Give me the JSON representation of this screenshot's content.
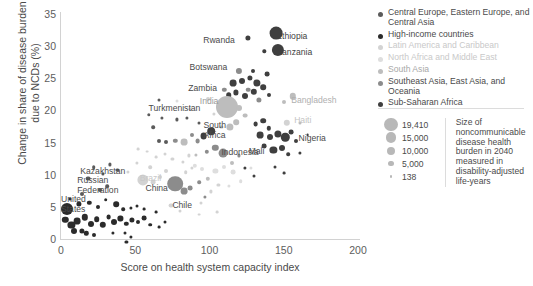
{
  "chart_data": {
    "type": "scatter",
    "title": "",
    "subtitle": "",
    "xlabel": "Score on health system capacity index",
    "ylabel": "Change in share of disease burden\ndue to NCDs (%)",
    "xlim": [
      0,
      200
    ],
    "ylim": [
      0,
      35
    ],
    "xticks": [
      0,
      50,
      100,
      150,
      200
    ],
    "yticks": [
      0,
      5,
      10,
      15,
      20,
      25,
      30,
      35
    ],
    "grid": false,
    "legend_position": "right",
    "size_metric": "Size of noncommunicable disease health burden in 2040 measured in disability-adjusted life-years",
    "size_legend": [
      {
        "value": "19,410",
        "px": 11
      },
      {
        "value": "15,000",
        "px": 8.6
      },
      {
        "value": "10,000",
        "px": 6.4
      },
      {
        "value": "5,000",
        "px": 4.2
      },
      {
        "value": "138",
        "px": 2.0
      }
    ],
    "groups": [
      {
        "name": "Central Europe, Eastern Europe, and Central Asia",
        "color": "#5b5b5b"
      },
      {
        "name": "High-income countries",
        "color": "#2b2b2b"
      },
      {
        "name": "Latin America and Caribbean",
        "color": "#d3d3d3"
      },
      {
        "name": "North Africa and Middle East",
        "color": "#dedede"
      },
      {
        "name": "South Asia",
        "color": "#bdbdbd"
      },
      {
        "name": "Southeast Asia, East Asia, and Oceania",
        "color": "#8c8c8c"
      },
      {
        "name": "Sub-Saharan Africa",
        "color": "#3f3f3f"
      }
    ],
    "annotations": [
      {
        "text": "Ethiopia",
        "x": 145,
        "y": 31.5,
        "anchor": "left",
        "color": "#3f3f3f"
      },
      {
        "text": "Tanzania",
        "x": 146,
        "y": 29.0,
        "anchor": "left",
        "color": "#3f3f3f"
      },
      {
        "text": "Rwanda",
        "x": 117,
        "y": 30.8,
        "anchor": "right",
        "color": "#4a4a4a"
      },
      {
        "text": "Botswana",
        "x": 112,
        "y": 26.6,
        "anchor": "right",
        "color": "#4a4a4a"
      },
      {
        "text": "Zambia",
        "x": 105,
        "y": 23.4,
        "anchor": "right",
        "color": "#4a4a4a"
      },
      {
        "text": "India",
        "x": 106,
        "y": 21.3,
        "anchor": "right",
        "color": "#9a9a9a"
      },
      {
        "text": "Bangladesh",
        "x": 155,
        "y": 21.5,
        "anchor": "left",
        "color": "#b0b0b0"
      },
      {
        "text": "Haiti",
        "x": 157,
        "y": 18.3,
        "anchor": "left",
        "color": "#c4c4c4"
      },
      {
        "text": "Nigeria",
        "x": 160,
        "y": 15.6,
        "anchor": "left",
        "color": "#4a4a4a"
      },
      {
        "text": "Mali",
        "x": 137,
        "y": 13.6,
        "anchor": "right",
        "color": "#4a4a4a"
      },
      {
        "text": "Indonesia",
        "x": 108,
        "y": 13.4,
        "anchor": "left",
        "color": "#4a4a4a"
      },
      {
        "text": "Turkmenistan",
        "x": 59,
        "y": 20.3,
        "anchor": "left",
        "color": "#4a4a4a"
      },
      {
        "text": "South\nAfrica",
        "x": 96,
        "y": 16.8,
        "anchor": "left",
        "color": "#4a4a4a"
      },
      {
        "text": "Kazakhstan",
        "x": 13,
        "y": 10.4,
        "anchor": "left",
        "color": "#4a4a4a"
      },
      {
        "text": "Russian\nFederation",
        "x": 11,
        "y": 8.2,
        "anchor": "left",
        "color": "#4a4a4a"
      },
      {
        "text": "United\nStates",
        "x": 0,
        "y": 5.3,
        "anchor": "left",
        "color": "#4a4a4a"
      },
      {
        "text": "Brazil",
        "x": 53,
        "y": 9.4,
        "anchor": "left",
        "color": "#c9c9c9"
      },
      {
        "text": "China",
        "x": 72,
        "y": 7.8,
        "anchor": "right",
        "color": "#4a4a4a"
      },
      {
        "text": "Chile",
        "x": 75,
        "y": 5.2,
        "anchor": "left",
        "color": "#4a4a4a"
      }
    ],
    "points": [
      {
        "x": 145,
        "y": 32.0,
        "r": 6.4,
        "g": 6
      },
      {
        "x": 146,
        "y": 29.4,
        "r": 6.1,
        "g": 6
      },
      {
        "x": 126,
        "y": 31.3,
        "r": 2.6,
        "g": 6
      },
      {
        "x": 137,
        "y": 29.2,
        "r": 1.7,
        "g": 6
      },
      {
        "x": 129,
        "y": 26.2,
        "r": 2.0,
        "g": 6
      },
      {
        "x": 139,
        "y": 25.6,
        "r": 2.4,
        "g": 6
      },
      {
        "x": 116,
        "y": 24.3,
        "r": 3.4,
        "g": 6
      },
      {
        "x": 122,
        "y": 24.6,
        "r": 3.0,
        "g": 6
      },
      {
        "x": 127,
        "y": 25.0,
        "r": 2.6,
        "g": 6
      },
      {
        "x": 132,
        "y": 24.3,
        "r": 3.6,
        "g": 6
      },
      {
        "x": 136,
        "y": 23.6,
        "r": 2.8,
        "g": 6
      },
      {
        "x": 130,
        "y": 22.9,
        "r": 3.2,
        "g": 6
      },
      {
        "x": 124,
        "y": 22.2,
        "r": 3.0,
        "g": 6
      },
      {
        "x": 118,
        "y": 22.8,
        "r": 2.6,
        "g": 6
      },
      {
        "x": 113,
        "y": 22.4,
        "r": 2.8,
        "g": 6
      },
      {
        "x": 110,
        "y": 23.2,
        "r": 2.2,
        "g": 5
      },
      {
        "x": 120,
        "y": 26.1,
        "r": 3.1,
        "g": 5
      },
      {
        "x": 126,
        "y": 23.2,
        "r": 2.3,
        "g": 5
      },
      {
        "x": 133,
        "y": 21.6,
        "r": 2.6,
        "g": 5
      },
      {
        "x": 140,
        "y": 22.4,
        "r": 2.0,
        "g": 6
      },
      {
        "x": 112,
        "y": 20.6,
        "r": 11.0,
        "g": 4
      },
      {
        "x": 120,
        "y": 20.4,
        "r": 3.0,
        "g": 4
      },
      {
        "x": 124,
        "y": 19.2,
        "r": 2.4,
        "g": 4
      },
      {
        "x": 118,
        "y": 18.2,
        "r": 2.8,
        "g": 4
      },
      {
        "x": 114,
        "y": 17.4,
        "r": 3.6,
        "g": 4
      },
      {
        "x": 150,
        "y": 21.3,
        "r": 2.0,
        "g": 4
      },
      {
        "x": 152,
        "y": 18.1,
        "r": 3.2,
        "g": 2
      },
      {
        "x": 156,
        "y": 22.2,
        "r": 3.2,
        "g": 4
      },
      {
        "x": 131,
        "y": 17.9,
        "r": 2.4,
        "g": 6
      },
      {
        "x": 136,
        "y": 18.4,
        "r": 2.8,
        "g": 6
      },
      {
        "x": 140,
        "y": 17.2,
        "r": 2.2,
        "g": 6
      },
      {
        "x": 134,
        "y": 16.2,
        "r": 3.4,
        "g": 6
      },
      {
        "x": 141,
        "y": 15.8,
        "r": 3.0,
        "g": 6
      },
      {
        "x": 146,
        "y": 16.4,
        "r": 3.6,
        "g": 6
      },
      {
        "x": 151,
        "y": 15.8,
        "r": 4.2,
        "g": 6
      },
      {
        "x": 155,
        "y": 16.6,
        "r": 2.4,
        "g": 6
      },
      {
        "x": 158,
        "y": 15.2,
        "r": 2.0,
        "g": 6
      },
      {
        "x": 149,
        "y": 14.2,
        "r": 3.0,
        "g": 6
      },
      {
        "x": 143,
        "y": 13.9,
        "r": 3.6,
        "g": 6
      },
      {
        "x": 137,
        "y": 14.5,
        "r": 2.4,
        "g": 6
      },
      {
        "x": 153,
        "y": 13.2,
        "r": 1.8,
        "g": 6
      },
      {
        "x": 161,
        "y": 13.4,
        "r": 1.6,
        "g": 6
      },
      {
        "x": 96,
        "y": 16.0,
        "r": 3.4,
        "g": 6
      },
      {
        "x": 101,
        "y": 16.8,
        "r": 3.8,
        "g": 6
      },
      {
        "x": 92,
        "y": 15.2,
        "r": 2.4,
        "g": 5
      },
      {
        "x": 88,
        "y": 16.2,
        "r": 2.0,
        "g": 5
      },
      {
        "x": 83,
        "y": 15.1,
        "r": 3.4,
        "g": 4
      },
      {
        "x": 77,
        "y": 15.3,
        "r": 2.2,
        "g": 5
      },
      {
        "x": 71,
        "y": 15.1,
        "r": 2.0,
        "g": 0
      },
      {
        "x": 66,
        "y": 15.2,
        "r": 2.0,
        "g": 0
      },
      {
        "x": 62,
        "y": 17.4,
        "r": 1.8,
        "g": 0
      },
      {
        "x": 68,
        "y": 18.8,
        "r": 1.6,
        "g": 0
      },
      {
        "x": 78,
        "y": 18.6,
        "r": 1.6,
        "g": 0
      },
      {
        "x": 85,
        "y": 18.9,
        "r": 1.6,
        "g": 0
      },
      {
        "x": 59,
        "y": 19.3,
        "r": 1.7,
        "g": 0
      },
      {
        "x": 93,
        "y": 18.0,
        "r": 1.5,
        "g": 0
      },
      {
        "x": 104,
        "y": 14.2,
        "r": 3.2,
        "g": 5
      },
      {
        "x": 109,
        "y": 13.4,
        "r": 4.4,
        "g": 5
      },
      {
        "x": 98,
        "y": 13.6,
        "r": 2.2,
        "g": 5
      },
      {
        "x": 91,
        "y": 13.1,
        "r": 1.6,
        "g": 4
      },
      {
        "x": 86,
        "y": 13.0,
        "r": 1.6,
        "g": 2
      },
      {
        "x": 104,
        "y": 10.6,
        "r": 2.6,
        "g": 3
      },
      {
        "x": 110,
        "y": 11.2,
        "r": 2.0,
        "g": 3
      },
      {
        "x": 116,
        "y": 10.4,
        "r": 2.4,
        "g": 3
      },
      {
        "x": 99,
        "y": 9.4,
        "r": 2.2,
        "g": 4
      },
      {
        "x": 95,
        "y": 10.9,
        "r": 2.0,
        "g": 3
      },
      {
        "x": 121,
        "y": 9.0,
        "r": 1.8,
        "g": 3
      },
      {
        "x": 113,
        "y": 8.2,
        "r": 1.6,
        "g": 3
      },
      {
        "x": 106,
        "y": 8.4,
        "r": 1.6,
        "g": 2
      },
      {
        "x": 128,
        "y": 11.1,
        "r": 1.6,
        "g": 3
      },
      {
        "x": 90,
        "y": 11.4,
        "r": 2.2,
        "g": 3
      },
      {
        "x": 84,
        "y": 10.4,
        "r": 1.8,
        "g": 2
      },
      {
        "x": 77,
        "y": 8.6,
        "r": 7.8,
        "g": 5
      },
      {
        "x": 83,
        "y": 7.5,
        "r": 3.4,
        "g": 5
      },
      {
        "x": 87,
        "y": 7.9,
        "r": 2.4,
        "g": 5
      },
      {
        "x": 55,
        "y": 9.2,
        "r": 5.6,
        "g": 2
      },
      {
        "x": 62,
        "y": 8.9,
        "r": 2.4,
        "g": 2
      },
      {
        "x": 67,
        "y": 9.6,
        "r": 2.0,
        "g": 2
      },
      {
        "x": 71,
        "y": 10.6,
        "r": 2.0,
        "g": 2
      },
      {
        "x": 60,
        "y": 11.2,
        "r": 1.8,
        "g": 2
      },
      {
        "x": 51,
        "y": 11.8,
        "r": 1.6,
        "g": 2
      },
      {
        "x": 45,
        "y": 10.4,
        "r": 1.6,
        "g": 2
      },
      {
        "x": 93,
        "y": 8.8,
        "r": 1.8,
        "g": 5
      },
      {
        "x": 97,
        "y": 6.6,
        "r": 1.6,
        "g": 5
      },
      {
        "x": 74,
        "y": 5.2,
        "r": 2.4,
        "g": 2
      },
      {
        "x": 80,
        "y": 4.4,
        "r": 1.5,
        "g": 2
      },
      {
        "x": 18,
        "y": 9.4,
        "r": 2.4,
        "g": 0
      },
      {
        "x": 22,
        "y": 11.2,
        "r": 1.8,
        "g": 0
      },
      {
        "x": 28,
        "y": 10.1,
        "r": 1.6,
        "g": 0
      },
      {
        "x": 33,
        "y": 11.6,
        "r": 1.6,
        "g": 0
      },
      {
        "x": 38,
        "y": 10.8,
        "r": 1.6,
        "g": 0
      },
      {
        "x": 26,
        "y": 7.6,
        "r": 2.0,
        "g": 0
      },
      {
        "x": 31,
        "y": 8.2,
        "r": 1.8,
        "g": 0
      },
      {
        "x": 14,
        "y": 7.0,
        "r": 2.0,
        "g": 0
      },
      {
        "x": 4,
        "y": 4.6,
        "r": 6.0,
        "g": 1
      },
      {
        "x": 3,
        "y": 3.0,
        "r": 3.2,
        "g": 1
      },
      {
        "x": 7,
        "y": 2.2,
        "r": 3.6,
        "g": 1
      },
      {
        "x": 11,
        "y": 2.8,
        "r": 3.4,
        "g": 1
      },
      {
        "x": 9,
        "y": 1.2,
        "r": 3.0,
        "g": 1
      },
      {
        "x": 14,
        "y": 1.3,
        "r": 2.6,
        "g": 1
      },
      {
        "x": 16,
        "y": 3.4,
        "r": 3.2,
        "g": 1
      },
      {
        "x": 20,
        "y": 2.4,
        "r": 3.0,
        "g": 1
      },
      {
        "x": 24,
        "y": 3.1,
        "r": 2.8,
        "g": 1
      },
      {
        "x": 28,
        "y": 2.2,
        "r": 3.2,
        "g": 1
      },
      {
        "x": 32,
        "y": 3.4,
        "r": 2.4,
        "g": 1
      },
      {
        "x": 36,
        "y": 2.6,
        "r": 3.0,
        "g": 1
      },
      {
        "x": 40,
        "y": 3.2,
        "r": 2.6,
        "g": 1
      },
      {
        "x": 44,
        "y": 2.4,
        "r": 2.2,
        "g": 1
      },
      {
        "x": 48,
        "y": 3.0,
        "r": 2.6,
        "g": 1
      },
      {
        "x": 52,
        "y": 2.6,
        "r": 2.0,
        "g": 1
      },
      {
        "x": 56,
        "y": 3.2,
        "r": 2.4,
        "g": 1
      },
      {
        "x": 60,
        "y": 2.2,
        "r": 1.8,
        "g": 1
      },
      {
        "x": 12,
        "y": 5.4,
        "r": 2.6,
        "g": 1
      },
      {
        "x": 19,
        "y": 5.6,
        "r": 2.2,
        "g": 1
      },
      {
        "x": 25,
        "y": 5.0,
        "r": 2.0,
        "g": 1
      },
      {
        "x": 30,
        "y": 6.1,
        "r": 1.8,
        "g": 1
      },
      {
        "x": 37,
        "y": 5.4,
        "r": 2.8,
        "g": 1
      },
      {
        "x": 42,
        "y": 4.6,
        "r": 1.8,
        "g": 1
      },
      {
        "x": 47,
        "y": 4.8,
        "r": 1.6,
        "g": 1
      },
      {
        "x": 51,
        "y": 5.2,
        "r": 1.5,
        "g": 1
      },
      {
        "x": 56,
        "y": 4.6,
        "r": 1.4,
        "g": 1
      },
      {
        "x": 64,
        "y": 4.2,
        "r": 1.4,
        "g": 1
      },
      {
        "x": 35,
        "y": 1.0,
        "r": 1.6,
        "g": 1
      },
      {
        "x": 43,
        "y": 0.9,
        "r": 1.5,
        "g": 1
      },
      {
        "x": 44,
        "y": -0.4,
        "r": 1.6,
        "g": 1
      },
      {
        "x": 47,
        "y": 0.3,
        "r": 1.6,
        "g": 1
      },
      {
        "x": 70,
        "y": 2.6,
        "r": 1.5,
        "g": 1
      },
      {
        "x": 66,
        "y": 1.8,
        "r": 1.4,
        "g": 1
      },
      {
        "x": 22,
        "y": 0.6,
        "r": 2.0,
        "g": 1
      },
      {
        "x": 17,
        "y": 0.9,
        "r": 2.2,
        "g": 1
      },
      {
        "x": 6,
        "y": 6.2,
        "r": 1.6,
        "g": 1
      },
      {
        "x": 99,
        "y": 21.8,
        "r": 2.0,
        "g": 2
      },
      {
        "x": 103,
        "y": 19.4,
        "r": 1.6,
        "g": 2
      },
      {
        "x": 87,
        "y": 20.2,
        "r": 1.6,
        "g": 2
      },
      {
        "x": 78,
        "y": 21.4,
        "r": 1.5,
        "g": 3
      },
      {
        "x": 66,
        "y": 21.6,
        "r": 1.5,
        "g": 0
      },
      {
        "x": 108,
        "y": 17.4,
        "r": 1.6,
        "g": 4
      },
      {
        "x": 115,
        "y": 11.8,
        "r": 2.0,
        "g": 4
      },
      {
        "x": 120,
        "y": 13.0,
        "r": 1.6,
        "g": 5
      },
      {
        "x": 124,
        "y": 11.0,
        "r": 1.6,
        "g": 6
      },
      {
        "x": 130,
        "y": 9.8,
        "r": 1.5,
        "g": 6
      },
      {
        "x": 101,
        "y": 7.4,
        "r": 1.6,
        "g": 2
      },
      {
        "x": 94,
        "y": 5.6,
        "r": 1.5,
        "g": 2
      },
      {
        "x": 88,
        "y": 11.0,
        "r": 1.6,
        "g": 2
      },
      {
        "x": 82,
        "y": 12.0,
        "r": 1.6,
        "g": 2
      },
      {
        "x": 75,
        "y": 12.4,
        "r": 1.6,
        "g": 2
      },
      {
        "x": 70,
        "y": 13.2,
        "r": 1.5,
        "g": 2
      },
      {
        "x": 64,
        "y": 12.8,
        "r": 1.4,
        "g": 2
      },
      {
        "x": 58,
        "y": 13.6,
        "r": 1.4,
        "g": 2
      },
      {
        "x": 52,
        "y": 14.0,
        "r": 1.4,
        "g": 2
      },
      {
        "x": 161,
        "y": 18.0,
        "r": 1.5,
        "g": 4
      },
      {
        "x": 166,
        "y": 16.2,
        "r": 1.4,
        "g": 6
      },
      {
        "x": 144,
        "y": 11.2,
        "r": 1.5,
        "g": 6
      },
      {
        "x": 150,
        "y": 10.2,
        "r": 1.4,
        "g": 6
      },
      {
        "x": 93,
        "y": 3.8,
        "r": 1.4,
        "g": 2
      },
      {
        "x": 105,
        "y": 4.2,
        "r": 1.4,
        "g": 2
      }
    ]
  }
}
